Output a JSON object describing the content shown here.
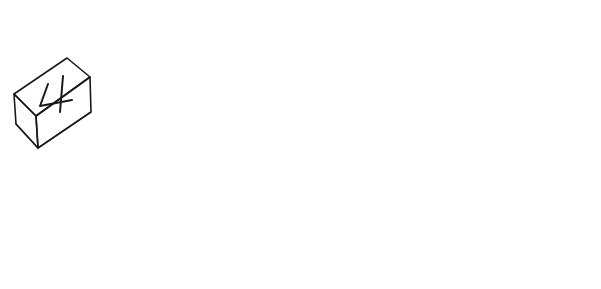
{
  "image": {
    "title": "Hand-drawn multiplication worksheet illustration",
    "style": "black ink line drawing on white background",
    "background_color": "#ffffff",
    "ink_color": "#1a1a1a",
    "width": 601,
    "height": 289
  },
  "blocks": {
    "group_label": "number blocks",
    "count": 4,
    "items": [
      {
        "digit": "4",
        "position": "top-left",
        "name": "block-4"
      },
      {
        "digit": "2",
        "position": "top-right",
        "name": "block-2"
      },
      {
        "digit": "9",
        "position": "bottom-left",
        "name": "block-9"
      },
      {
        "digit": "6",
        "position": "bottom-right",
        "name": "block-6"
      }
    ]
  },
  "paper": {
    "name": "worksheet-paper",
    "problem": {
      "multiplicand": "492",
      "operator": "×",
      "multiplier": "6",
      "answer": "",
      "answer_line_drawn": true
    }
  },
  "hand": {
    "name": "hand-holding-pencil",
    "pencil": {
      "tip_color": "#111111",
      "has_eraser": true,
      "has_ferrule": true
    },
    "action": "drawing the answer line"
  }
}
